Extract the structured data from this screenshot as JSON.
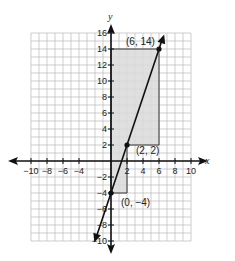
{
  "chart_data": {
    "type": "line",
    "title": "",
    "xlabel": "x",
    "ylabel": "y",
    "xlim": [
      -10,
      10
    ],
    "ylim": [
      -10,
      16
    ],
    "grid": true,
    "x_ticks": [
      -10,
      -8,
      -6,
      -4,
      2,
      4,
      6,
      8,
      10
    ],
    "x_tick_labels": [
      "−10",
      "−8",
      "−6",
      "−4",
      "2",
      "4",
      "6",
      "8",
      "10"
    ],
    "y_ticks": [
      16,
      14,
      12,
      10,
      8,
      6,
      4,
      2,
      -2,
      -4,
      -6,
      -8,
      -10
    ],
    "y_tick_labels": [
      "16",
      "14",
      "12",
      "10",
      "8",
      "6",
      "4",
      "2",
      "−2",
      "−4",
      "−6",
      "−8",
      "−10"
    ],
    "series": [
      {
        "name": "line",
        "equation": "y = 3x - 4",
        "x": [
          -1.9,
          0,
          2,
          6,
          6.4
        ],
        "y": [
          -9.7,
          -4,
          2,
          14,
          15.2
        ]
      }
    ],
    "points": [
      {
        "x": 0,
        "y": -4,
        "label": "(0, −4)"
      },
      {
        "x": 2,
        "y": 2,
        "label": "(2, 2)"
      },
      {
        "x": 6,
        "y": 14,
        "label": "(6, 14)"
      }
    ],
    "shaded_regions": [
      {
        "x_range": [
          0,
          2
        ],
        "y_range": [
          -4,
          2
        ]
      },
      {
        "x_range": [
          0,
          6
        ],
        "y_range": [
          2,
          14
        ]
      }
    ],
    "colors": {
      "grid": "#b8b8b8",
      "shade": "#d9d9d9",
      "line": "#111111"
    }
  }
}
